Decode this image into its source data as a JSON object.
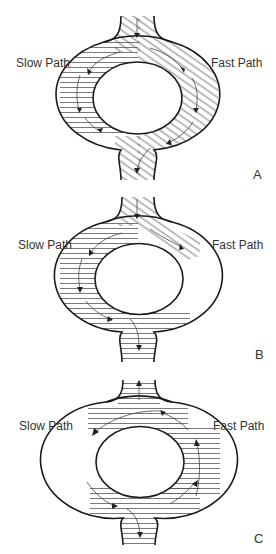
{
  "figure": {
    "panels": [
      {
        "id": "A",
        "letter": "A",
        "slow_label": "Slow Path",
        "fast_label": "Fast Path",
        "description": "Impulse enters top, splits into slow (left) and fast (right) paths; fast path reaches bottom first and exits, slow path blocked at lower-left"
      },
      {
        "id": "B",
        "letter": "B",
        "slow_label": "Slow Path",
        "fast_label": "Fast Path",
        "description": "Fast path blocked at upper-right; impulse travels down slow path and exits at bottom, also entering fast path retrogradely from below"
      },
      {
        "id": "C",
        "letter": "C",
        "slow_label": "Slow Path",
        "fast_label": "Fast Path",
        "description": "Re-entry circuit: impulse travels down slow path, returns up fast path, exits top and re-enters slow path"
      }
    ],
    "colors": {
      "stroke": "#1a1a1a",
      "hatch": "#555555",
      "arrow": "#333333",
      "background": "#ffffff"
    }
  }
}
